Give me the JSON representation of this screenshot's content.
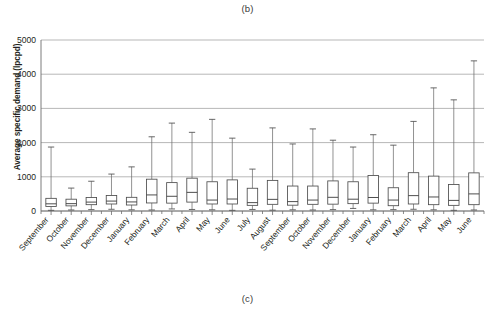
{
  "figure": {
    "caption_top": "(b)",
    "caption_bottom": "(c)"
  },
  "chart_data": {
    "type": "box",
    "title": "",
    "xlabel": "",
    "ylabel": "Average specific demand (lpcpd)",
    "ylim": [
      0,
      5000
    ],
    "ytick_values": [
      0,
      1000,
      2000,
      3000,
      4000,
      5000
    ],
    "ytick_labels": [
      "0",
      "1000",
      "2000",
      "3000",
      "4000",
      "5000"
    ],
    "grid": true,
    "legend": "none",
    "categories": [
      "September",
      "October",
      "November",
      "December",
      "January",
      "February",
      "March",
      "April",
      "May",
      "June",
      "July",
      "August",
      "September",
      "October",
      "November",
      "December",
      "January",
      "February",
      "March",
      "April",
      "May",
      "June"
    ],
    "boxes": [
      {
        "category": "September",
        "whisker_low": 20,
        "q1": 130,
        "median": 210,
        "q3": 370,
        "whisker_high": 1870
      },
      {
        "category": "October",
        "whisker_low": 30,
        "q1": 150,
        "median": 215,
        "q3": 345,
        "whisker_high": 670
      },
      {
        "category": "November",
        "whisker_low": 40,
        "q1": 185,
        "median": 260,
        "q3": 395,
        "whisker_high": 870
      },
      {
        "category": "December",
        "whisker_low": 50,
        "q1": 205,
        "median": 290,
        "q3": 455,
        "whisker_high": 1080
      },
      {
        "category": "January",
        "whisker_low": 35,
        "q1": 175,
        "median": 265,
        "q3": 400,
        "whisker_high": 1290
      },
      {
        "category": "February",
        "whisker_low": 30,
        "q1": 235,
        "median": 470,
        "q3": 930,
        "whisker_high": 2170
      },
      {
        "category": "March",
        "whisker_low": 60,
        "q1": 230,
        "median": 430,
        "q3": 830,
        "whisker_high": 2570
      },
      {
        "category": "April",
        "whisker_low": 45,
        "q1": 260,
        "median": 545,
        "q3": 960,
        "whisker_high": 2300
      },
      {
        "category": "May",
        "whisker_low": 35,
        "q1": 205,
        "median": 320,
        "q3": 855,
        "whisker_high": 2680
      },
      {
        "category": "June",
        "whisker_low": 20,
        "q1": 205,
        "median": 350,
        "q3": 910,
        "whisker_high": 2130
      },
      {
        "category": "July",
        "whisker_low": 45,
        "q1": 165,
        "median": 245,
        "q3": 665,
        "whisker_high": 1225
      },
      {
        "category": "August",
        "whisker_low": 25,
        "q1": 195,
        "median": 340,
        "q3": 895,
        "whisker_high": 2430
      },
      {
        "category": "September",
        "whisker_low": 35,
        "q1": 170,
        "median": 275,
        "q3": 730,
        "whisker_high": 1960
      },
      {
        "category": "October",
        "whisker_low": 30,
        "q1": 195,
        "median": 320,
        "q3": 730,
        "whisker_high": 2400
      },
      {
        "category": "November",
        "whisker_low": 40,
        "q1": 200,
        "median": 400,
        "q3": 880,
        "whisker_high": 2070
      },
      {
        "category": "December",
        "whisker_low": 75,
        "q1": 215,
        "median": 345,
        "q3": 855,
        "whisker_high": 1870
      },
      {
        "category": "January",
        "whisker_low": 35,
        "q1": 230,
        "median": 395,
        "q3": 1040,
        "whisker_high": 2230
      },
      {
        "category": "February",
        "whisker_low": 40,
        "q1": 155,
        "median": 320,
        "q3": 680,
        "whisker_high": 1925
      },
      {
        "category": "March",
        "whisker_low": 50,
        "q1": 205,
        "median": 450,
        "q3": 1120,
        "whisker_high": 2620
      },
      {
        "category": "April",
        "whisker_low": 35,
        "q1": 185,
        "median": 410,
        "q3": 1020,
        "whisker_high": 3600
      },
      {
        "category": "May",
        "whisker_low": 20,
        "q1": 165,
        "median": 310,
        "q3": 775,
        "whisker_high": 3250
      },
      {
        "category": "June",
        "whisker_low": 30,
        "q1": 185,
        "median": 500,
        "q3": 1115,
        "whisker_high": 4390
      }
    ]
  }
}
